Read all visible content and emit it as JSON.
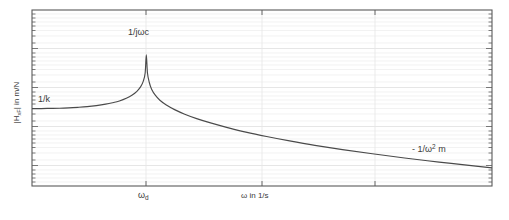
{
  "figure": {
    "background_color": "#ffffff",
    "plot_background_color": "#ffffff",
    "axis_color": "#5a5a5a",
    "grid_color": "#ececec",
    "curve_color": "#4a4a4a",
    "text_color": "#3a3a3a"
  },
  "axes": {
    "x": {
      "label_main": "ω in 1/s",
      "label_omega": "ω",
      "label_omega_sub": "d",
      "scale": "log",
      "tick_labels": [
        "ω_d"
      ],
      "minor_ticks": true
    },
    "y": {
      "label_prefix": "|H",
      "label_sub": "xF",
      "label_suffix": "| in m/N",
      "label_full": "|H_xF| in m/N",
      "scale": "log",
      "tick_labels": [],
      "minor_ticks": true
    }
  },
  "annotations": {
    "stiffness": {
      "text": "1/k",
      "description": "stiffness-controlled low frequency asymptote"
    },
    "damping": {
      "text": "1/jωc",
      "description": "damping-controlled resonance peak"
    },
    "mass": {
      "text_prefix": "- 1/ω",
      "text_sup": "2",
      "text_suffix": " m",
      "text_full": "- 1/ω2 m",
      "description": "mass-controlled high frequency asymptote"
    }
  },
  "chart_data": {
    "type": "line",
    "title": "",
    "xlabel": "ω in 1/s",
    "ylabel": "|H_xF| in m/N",
    "xscale": "log",
    "yscale": "log",
    "grid": true,
    "legend": null,
    "xlim": [
      0,
      1
    ],
    "ylim": [
      0,
      1
    ],
    "resonance_x_normalized": 0.248,
    "series": [
      {
        "name": "|H_xF|",
        "description": "Receptance magnitude of a single degree of freedom mass-spring-damper system versus frequency, log-log scale",
        "points_normalized": [
          [
            0.0,
            0.56
          ],
          [
            0.02,
            0.56
          ],
          [
            0.04,
            0.559
          ],
          [
            0.06,
            0.558
          ],
          [
            0.08,
            0.556
          ],
          [
            0.1,
            0.553
          ],
          [
            0.12,
            0.549
          ],
          [
            0.14,
            0.543
          ],
          [
            0.16,
            0.535
          ],
          [
            0.175,
            0.527
          ],
          [
            0.19,
            0.517
          ],
          [
            0.205,
            0.502
          ],
          [
            0.218,
            0.483
          ],
          [
            0.228,
            0.462
          ],
          [
            0.236,
            0.437
          ],
          [
            0.242,
            0.404
          ],
          [
            0.246,
            0.358
          ],
          [
            0.2485,
            0.255
          ],
          [
            0.251,
            0.358
          ],
          [
            0.255,
            0.412
          ],
          [
            0.26,
            0.45
          ],
          [
            0.268,
            0.484
          ],
          [
            0.278,
            0.513
          ],
          [
            0.292,
            0.54
          ],
          [
            0.31,
            0.566
          ],
          [
            0.332,
            0.592
          ],
          [
            0.358,
            0.617
          ],
          [
            0.39,
            0.643
          ],
          [
            0.425,
            0.668
          ],
          [
            0.465,
            0.694
          ],
          [
            0.51,
            0.719
          ],
          [
            0.56,
            0.744
          ],
          [
            0.615,
            0.769
          ],
          [
            0.675,
            0.793
          ],
          [
            0.74,
            0.817
          ],
          [
            0.81,
            0.841
          ],
          [
            0.885,
            0.864
          ],
          [
            0.96,
            0.886
          ],
          [
            1.0,
            0.897
          ]
        ]
      }
    ],
    "annotations": [
      {
        "text": "1/k",
        "x_normalized": 0.03,
        "y_normalized": 0.52,
        "meaning": "low-frequency stiffness line"
      },
      {
        "text": "1/jωc",
        "x_normalized": 0.25,
        "y_normalized": 0.13,
        "meaning": "resonance peak value"
      },
      {
        "text": "- 1/ω2 m",
        "x_normalized": 0.84,
        "y_normalized": 0.78,
        "meaning": "high-frequency mass line"
      }
    ]
  }
}
